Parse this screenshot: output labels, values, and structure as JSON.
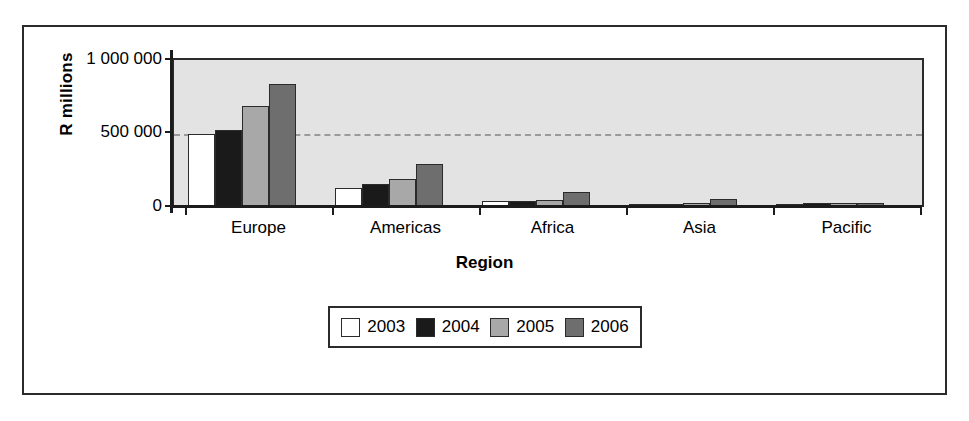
{
  "chart_data": {
    "type": "bar",
    "title": "",
    "xlabel": "Region",
    "ylabel": "R millions",
    "categories": [
      "Europe",
      "Americas",
      "Africa",
      "Asia",
      "Pacific"
    ],
    "series": [
      {
        "name": "2003",
        "color": "#ffffff",
        "values": [
          500000,
          130000,
          40000,
          20000,
          22000
        ]
      },
      {
        "name": "2004",
        "color": "#1a1a1a",
        "values": [
          525000,
          155000,
          42000,
          22000,
          25000
        ]
      },
      {
        "name": "2005",
        "color": "#a8a8a8",
        "values": [
          690000,
          190000,
          48000,
          25000,
          26000
        ]
      },
      {
        "name": "2006",
        "color": "#6e6e6e",
        "values": [
          840000,
          295000,
          100000,
          52000,
          28000
        ]
      }
    ],
    "ylim": [
      0,
      1000000
    ],
    "yticks": [
      "0",
      "500 000",
      "1 000 000"
    ],
    "ytick_values": [
      0,
      500000,
      1000000
    ],
    "grid": "horizontal-dashed-at-500000",
    "legend_position": "bottom-center",
    "plot_background": "#e3e3e3"
  },
  "legend": {
    "entries": [
      {
        "label": "2003"
      },
      {
        "label": "2004"
      },
      {
        "label": "2005"
      },
      {
        "label": "2006"
      }
    ]
  }
}
